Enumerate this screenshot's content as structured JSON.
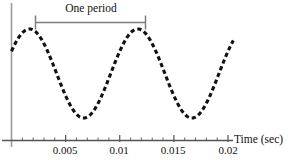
{
  "chart_data": {
    "type": "line",
    "title": "",
    "subtitle": "",
    "xlabel": "Time (sec)",
    "ylabel": "",
    "xlim": [
      0,
      0.0205
    ],
    "ylim": [
      -1.15,
      1.15
    ],
    "grid": false,
    "legend_position": "none",
    "x_ticks_major": [
      "0.005",
      "0.01",
      "0.015",
      "0.02"
    ],
    "x_tick_major_values": [
      0.005,
      0.01,
      0.015,
      0.02
    ],
    "x_tick_minor_step": 0.001,
    "series": [
      {
        "name": "sinusoid",
        "style": "dashed",
        "color": "#111111",
        "waveform": "sine",
        "amplitude": 1.0,
        "period_sec": 0.01,
        "frequency_hz": 100,
        "phase_deg": 30,
        "x_start": 0.0,
        "x_end": 0.0205,
        "description": "Dashed sinusoid with two full crests; starts mid-rise at t=0, peaks near t=0.0025 and t=0.0125, troughs near t=0.0075 and t=0.0175"
      }
    ],
    "annotations": [
      {
        "name": "one-period-span",
        "label": "One period",
        "x_from": 0.0025,
        "x_to": 0.0125,
        "span_sec": 0.01,
        "style": "capped-bar-above-curve",
        "color": "#777777"
      }
    ],
    "axes": {
      "x_axis_color": "#555555",
      "y_axis_color": "#999999",
      "x_axis_label": "Time (sec)"
    }
  },
  "annotation": {
    "one_period_label": "One period"
  },
  "axis": {
    "time_label": "Time (sec)"
  },
  "ticks": {
    "t1": "0.005",
    "t2": "0.01",
    "t3": "0.015",
    "t4": "0.02"
  }
}
